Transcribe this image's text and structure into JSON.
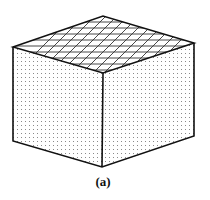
{
  "figure": {
    "caption": "(a)",
    "shape": "cube",
    "faces": {
      "top": "cross-hatched",
      "left": "stippled",
      "right": "stippled"
    },
    "colors": {
      "stroke": "#111111",
      "hatch": "#333333",
      "dots": "#8a8a8a",
      "background": "#ffffff"
    }
  }
}
